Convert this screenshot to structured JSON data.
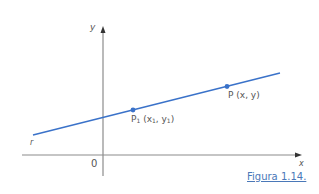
{
  "figure": {
    "caption": "Figura 1.14.",
    "axes": {
      "x_label": "x",
      "y_label": "y",
      "origin_label": "0"
    },
    "line": {
      "label": "r",
      "color": "#3a72c9"
    },
    "points": [
      {
        "name": "P",
        "sub": "1",
        "coords_open": " (x",
        "coords_sub1": "1",
        "coords_mid": ", y",
        "coords_sub2": "1",
        "coords_close": ")"
      },
      {
        "name": "P",
        "coords": " (x, y)"
      }
    ],
    "colors": {
      "axis": "#888888",
      "line": "#3a72c9",
      "point": "#3a72c9",
      "caption": "#4a78b8"
    }
  }
}
